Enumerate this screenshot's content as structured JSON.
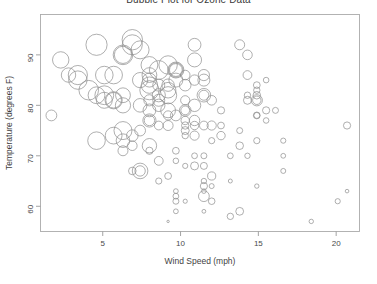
{
  "chart_data": {
    "type": "scatter",
    "variant": "bubble",
    "title": "Bubble Plot for Ozone Data",
    "xlabel": "Wind Speed (mph)",
    "ylabel": "Temperature (degrees F)",
    "xlim": [
      1.0,
      21.5
    ],
    "ylim": [
      55.0,
      98.0
    ],
    "xticks": [
      5,
      10,
      15,
      20
    ],
    "yticks": [
      60,
      70,
      80,
      90
    ],
    "grid": false,
    "legend": null,
    "frame": true,
    "bubble_encoding": "circle radius encodes Ozone concentration (ppb)",
    "marker_style": "open circles, grey stroke, no fill",
    "series": [
      {
        "name": "Ozone observations",
        "color": "#8c8c8c",
        "points": [
          {
            "x": 7.4,
            "y": 67,
            "r": 7.8
          },
          {
            "x": 8.0,
            "y": 72,
            "r": 7.2
          },
          {
            "x": 12.6,
            "y": 74,
            "r": 4.2
          },
          {
            "x": 11.5,
            "y": 62,
            "r": 5.4
          },
          {
            "x": 8.6,
            "y": 65,
            "r": 3.1
          },
          {
            "x": 13.8,
            "y": 59,
            "r": 3.9
          },
          {
            "x": 20.1,
            "y": 61,
            "r": 2.6
          },
          {
            "x": 8.6,
            "y": 69,
            "r": 4.4
          },
          {
            "x": 6.9,
            "y": 74,
            "r": 5.8
          },
          {
            "x": 9.7,
            "y": 69,
            "r": 2.8
          },
          {
            "x": 9.2,
            "y": 66,
            "r": 3.4
          },
          {
            "x": 10.9,
            "y": 68,
            "r": 4.0
          },
          {
            "x": 13.2,
            "y": 58,
            "r": 3.2
          },
          {
            "x": 11.5,
            "y": 64,
            "r": 3.6
          },
          {
            "x": 12.0,
            "y": 66,
            "r": 4.1
          },
          {
            "x": 18.4,
            "y": 57,
            "r": 2.2
          },
          {
            "x": 11.5,
            "y": 68,
            "r": 3.5
          },
          {
            "x": 9.7,
            "y": 62,
            "r": 2.9
          },
          {
            "x": 9.7,
            "y": 59,
            "r": 2.4
          },
          {
            "x": 16.6,
            "y": 73,
            "r": 2.6
          },
          {
            "x": 9.7,
            "y": 61,
            "r": 3.0
          },
          {
            "x": 12.0,
            "y": 61,
            "r": 3.3
          },
          {
            "x": 16.6,
            "y": 67,
            "r": 2.5
          },
          {
            "x": 14.9,
            "y": 81,
            "r": 5.6
          },
          {
            "x": 8.0,
            "y": 79,
            "r": 6.4
          },
          {
            "x": 12.0,
            "y": 76,
            "r": 4.6
          },
          {
            "x": 14.9,
            "y": 78,
            "r": 3.4
          },
          {
            "x": 5.7,
            "y": 74,
            "r": 8.4
          },
          {
            "x": 7.4,
            "y": 67,
            "r": 5.2
          },
          {
            "x": 8.6,
            "y": 84,
            "r": 6.0
          },
          {
            "x": 9.7,
            "y": 85,
            "r": 7.0
          },
          {
            "x": 16.1,
            "y": 79,
            "r": 3.0
          },
          {
            "x": 9.2,
            "y": 82,
            "r": 8.6
          },
          {
            "x": 8.6,
            "y": 87,
            "r": 9.4
          },
          {
            "x": 14.3,
            "y": 90,
            "r": 4.8
          },
          {
            "x": 9.7,
            "y": 87,
            "r": 8.0
          },
          {
            "x": 6.9,
            "y": 93,
            "r": 10.2
          },
          {
            "x": 13.8,
            "y": 92,
            "r": 5.0
          },
          {
            "x": 11.5,
            "y": 82,
            "r": 6.8
          },
          {
            "x": 10.9,
            "y": 80,
            "r": 6.2
          },
          {
            "x": 9.2,
            "y": 79,
            "r": 7.4
          },
          {
            "x": 8.0,
            "y": 77,
            "r": 6.6
          },
          {
            "x": 13.8,
            "y": 72,
            "r": 3.8
          },
          {
            "x": 11.5,
            "y": 65,
            "r": 2.7
          },
          {
            "x": 14.9,
            "y": 73,
            "r": 3.1
          },
          {
            "x": 20.7,
            "y": 76,
            "r": 3.6
          },
          {
            "x": 9.2,
            "y": 76,
            "r": 5.0
          },
          {
            "x": 11.5,
            "y": 76,
            "r": 4.4
          },
          {
            "x": 10.3,
            "y": 76,
            "r": 3.7
          },
          {
            "x": 6.3,
            "y": 75,
            "r": 9.0
          },
          {
            "x": 1.7,
            "y": 78,
            "r": 5.4
          },
          {
            "x": 4.6,
            "y": 73,
            "r": 8.8
          },
          {
            "x": 6.3,
            "y": 80,
            "r": 7.6
          },
          {
            "x": 8.0,
            "y": 77,
            "r": 5.2
          },
          {
            "x": 8.0,
            "y": 83,
            "r": 9.6
          },
          {
            "x": 10.3,
            "y": 84,
            "r": 5.8
          },
          {
            "x": 11.5,
            "y": 85,
            "r": 6.0
          },
          {
            "x": 14.9,
            "y": 81,
            "r": 4.2
          },
          {
            "x": 8.0,
            "y": 84,
            "r": 8.2
          },
          {
            "x": 4.1,
            "y": 83,
            "r": 9.8
          },
          {
            "x": 9.2,
            "y": 83,
            "r": 7.8
          },
          {
            "x": 9.2,
            "y": 88,
            "r": 9.2
          },
          {
            "x": 10.9,
            "y": 92,
            "r": 6.4
          },
          {
            "x": 4.6,
            "y": 92,
            "r": 10.6
          },
          {
            "x": 10.9,
            "y": 89,
            "r": 7.0
          },
          {
            "x": 5.1,
            "y": 82,
            "r": 9.4
          },
          {
            "x": 6.3,
            "y": 73,
            "r": 6.8
          },
          {
            "x": 5.7,
            "y": 81,
            "r": 8.6
          },
          {
            "x": 7.4,
            "y": 91,
            "r": 9.0
          },
          {
            "x": 8.6,
            "y": 80,
            "r": 6.2
          },
          {
            "x": 14.3,
            "y": 81,
            "r": 4.0
          },
          {
            "x": 14.9,
            "y": 82,
            "r": 3.8
          },
          {
            "x": 14.9,
            "y": 84,
            "r": 3.4
          },
          {
            "x": 9.7,
            "y": 87,
            "r": 7.2
          },
          {
            "x": 3.4,
            "y": 85,
            "r": 9.2
          },
          {
            "x": 10.9,
            "y": 74,
            "r": 4.6
          },
          {
            "x": 5.1,
            "y": 81,
            "r": 8.0
          },
          {
            "x": 6.3,
            "y": 82,
            "r": 7.4
          },
          {
            "x": 5.7,
            "y": 86,
            "r": 8.8
          },
          {
            "x": 7.4,
            "y": 85,
            "r": 7.6
          },
          {
            "x": 8.6,
            "y": 82,
            "r": 6.6
          },
          {
            "x": 14.3,
            "y": 86,
            "r": 4.4
          },
          {
            "x": 8.0,
            "y": 88,
            "r": 8.4
          },
          {
            "x": 11.5,
            "y": 86,
            "r": 5.6
          },
          {
            "x": 14.9,
            "y": 83,
            "r": 3.2
          },
          {
            "x": 8.6,
            "y": 81,
            "r": 6.0
          },
          {
            "x": 5.7,
            "y": 81,
            "r": 7.8
          },
          {
            "x": 12.0,
            "y": 81,
            "r": 4.8
          },
          {
            "x": 11.5,
            "y": 82,
            "r": 5.0
          },
          {
            "x": 3.4,
            "y": 86,
            "r": 9.6
          },
          {
            "x": 8.0,
            "y": 85,
            "r": 7.0
          },
          {
            "x": 9.7,
            "y": 87,
            "r": 6.4
          },
          {
            "x": 2.3,
            "y": 89,
            "r": 8.2
          },
          {
            "x": 6.3,
            "y": 90,
            "r": 9.8
          },
          {
            "x": 6.3,
            "y": 90,
            "r": 8.6
          },
          {
            "x": 6.9,
            "y": 92,
            "r": 10.0
          },
          {
            "x": 5.1,
            "y": 86,
            "r": 8.8
          },
          {
            "x": 2.8,
            "y": 86,
            "r": 7.2
          },
          {
            "x": 4.6,
            "y": 82,
            "r": 8.4
          },
          {
            "x": 7.4,
            "y": 80,
            "r": 6.8
          },
          {
            "x": 15.5,
            "y": 79,
            "r": 3.6
          },
          {
            "x": 10.9,
            "y": 77,
            "r": 5.2
          },
          {
            "x": 10.3,
            "y": 79,
            "r": 5.8
          },
          {
            "x": 10.9,
            "y": 76,
            "r": 4.2
          },
          {
            "x": 9.7,
            "y": 78,
            "r": 5.4
          },
          {
            "x": 14.9,
            "y": 78,
            "r": 3.0
          },
          {
            "x": 15.5,
            "y": 77,
            "r": 2.8
          },
          {
            "x": 6.9,
            "y": 72,
            "r": 4.8
          },
          {
            "x": 10.3,
            "y": 75,
            "r": 4.0
          },
          {
            "x": 10.3,
            "y": 79,
            "r": 4.4
          },
          {
            "x": 8.0,
            "y": 81,
            "r": 5.6
          },
          {
            "x": 12.6,
            "y": 76,
            "r": 3.4
          },
          {
            "x": 9.2,
            "y": 78,
            "r": 4.6
          },
          {
            "x": 10.3,
            "y": 74,
            "r": 3.2
          },
          {
            "x": 10.3,
            "y": 68,
            "r": 2.6
          },
          {
            "x": 16.6,
            "y": 70,
            "r": 2.4
          },
          {
            "x": 6.9,
            "y": 67,
            "r": 3.8
          },
          {
            "x": 13.2,
            "y": 70,
            "r": 2.9
          },
          {
            "x": 14.3,
            "y": 70,
            "r": 2.7
          },
          {
            "x": 8.0,
            "y": 71,
            "r": 3.6
          },
          {
            "x": 11.5,
            "y": 63,
            "r": 2.3
          },
          {
            "x": 14.9,
            "y": 64,
            "r": 2.2
          },
          {
            "x": 20.7,
            "y": 63,
            "r": 1.8
          },
          {
            "x": 9.2,
            "y": 57,
            "r": 1.2
          },
          {
            "x": 11.5,
            "y": 70,
            "r": 3.0
          },
          {
            "x": 10.3,
            "y": 77,
            "r": 4.2
          },
          {
            "x": 6.3,
            "y": 71,
            "r": 5.0
          },
          {
            "x": 7.4,
            "y": 75,
            "r": 5.4
          },
          {
            "x": 10.9,
            "y": 85,
            "r": 5.2
          },
          {
            "x": 10.3,
            "y": 86,
            "r": 4.8
          },
          {
            "x": 15.5,
            "y": 85,
            "r": 2.8
          },
          {
            "x": 14.3,
            "y": 82,
            "r": 3.2
          },
          {
            "x": 12.6,
            "y": 79,
            "r": 3.6
          },
          {
            "x": 9.7,
            "y": 71,
            "r": 3.4
          },
          {
            "x": 12.0,
            "y": 64,
            "r": 2.5
          },
          {
            "x": 10.3,
            "y": 61,
            "r": 2.1
          },
          {
            "x": 13.2,
            "y": 65,
            "r": 2.0
          },
          {
            "x": 11.5,
            "y": 59,
            "r": 1.9
          },
          {
            "x": 9.7,
            "y": 63,
            "r": 2.4
          },
          {
            "x": 10.9,
            "y": 70,
            "r": 2.9
          },
          {
            "x": 12.0,
            "y": 73,
            "r": 3.1
          },
          {
            "x": 8.6,
            "y": 76,
            "r": 4.4
          },
          {
            "x": 13.8,
            "y": 75,
            "r": 3.0
          },
          {
            "x": 10.3,
            "y": 81,
            "r": 4.6
          },
          {
            "x": 9.2,
            "y": 84,
            "r": 6.2
          },
          {
            "x": 8.0,
            "y": 86,
            "r": 7.4
          }
        ]
      }
    ]
  },
  "axes": {
    "x_tick_labels": [
      "5",
      "10",
      "15",
      "20"
    ],
    "y_tick_labels": [
      "60",
      "70",
      "80",
      "90"
    ]
  }
}
